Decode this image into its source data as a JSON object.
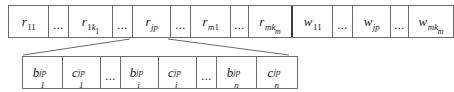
{
  "diagram": {
    "type": "two-level-chromosome-encoding",
    "line_color": "#6b6b6b",
    "text_color": "#1a1a1a",
    "background": "#ffffff",
    "top_row": {
      "name": "top-level-chromosome",
      "segments": [
        {
          "id": "r11",
          "kind": "gene",
          "base": "r",
          "sub": "11",
          "subsub": "",
          "sup": ""
        },
        {
          "id": "ell1",
          "kind": "ellipsis",
          "label": "..."
        },
        {
          "id": "r1km",
          "kind": "gene",
          "base": "r",
          "sub": "1k",
          "subsub": "1",
          "sup": ""
        },
        {
          "id": "ell2",
          "kind": "ellipsis",
          "label": "..."
        },
        {
          "id": "rjp",
          "kind": "gene",
          "base": "r",
          "sub": "jp",
          "subsub": "",
          "sup": "",
          "italic_sub": true,
          "expanded": true
        },
        {
          "id": "ell3",
          "kind": "ellipsis",
          "label": "..."
        },
        {
          "id": "rm1",
          "kind": "gene",
          "base": "r",
          "sub": "m1",
          "subsub": "",
          "sup": "",
          "italic_sub": true
        },
        {
          "id": "ell4",
          "kind": "ellipsis",
          "label": "..."
        },
        {
          "id": "rmkm",
          "kind": "gene",
          "base": "r",
          "sub": "mk",
          "subsub": "m",
          "sup": "",
          "italic_sub": true,
          "divider_after": true
        },
        {
          "id": "w11",
          "kind": "gene",
          "base": "w",
          "sub": "11",
          "subsub": "",
          "sup": ""
        },
        {
          "id": "ell5",
          "kind": "ellipsis",
          "label": "..."
        },
        {
          "id": "wjp",
          "kind": "gene",
          "base": "w",
          "sub": "jp",
          "subsub": "",
          "sup": "",
          "italic_sub": true
        },
        {
          "id": "ell6",
          "kind": "ellipsis",
          "label": "..."
        },
        {
          "id": "wmkm",
          "kind": "gene",
          "base": "w",
          "sub": "mk",
          "subsub": "m",
          "sup": "",
          "italic_sub": true
        }
      ]
    },
    "bottom_row": {
      "name": "expanded-sub-chromosome",
      "expanded_from": "rjp",
      "segments": [
        {
          "id": "b1",
          "kind": "gene",
          "base": "b",
          "sup": "jp",
          "sub": "1"
        },
        {
          "id": "c1",
          "kind": "gene",
          "base": "c",
          "sup": "jp",
          "sub": "1"
        },
        {
          "id": "bell1",
          "kind": "ellipsis",
          "label": "..."
        },
        {
          "id": "bi",
          "kind": "gene",
          "base": "b",
          "sup": "jp",
          "sub": "i"
        },
        {
          "id": "ci",
          "kind": "gene",
          "base": "c",
          "sup": "jp",
          "sub": "i"
        },
        {
          "id": "bell2",
          "kind": "ellipsis",
          "label": "..."
        },
        {
          "id": "bn",
          "kind": "gene",
          "base": "b",
          "sup": "jp",
          "sub": "n"
        },
        {
          "id": "cn",
          "kind": "gene",
          "base": "c",
          "sup": "jp",
          "sub": "n"
        }
      ]
    }
  }
}
